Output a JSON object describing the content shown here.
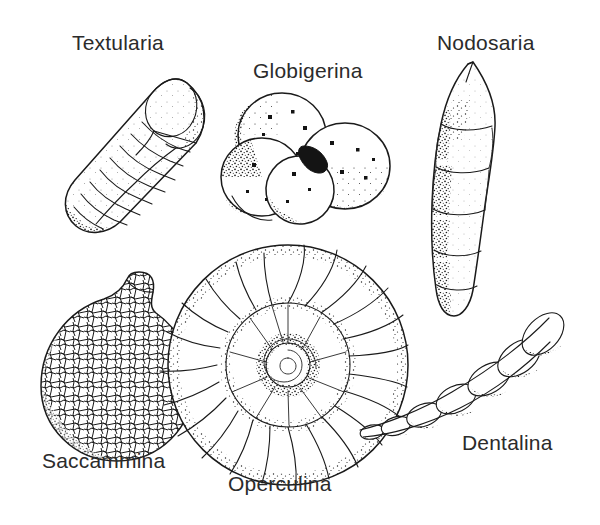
{
  "plate": {
    "title": "Foraminifera genera illustration plate",
    "background_color": "#ffffff",
    "ink_color": "#1a1a1a",
    "label_color": "#2b2b2b",
    "style": "black and white stippled line drawing"
  },
  "specimens": [
    {
      "id": "textularia",
      "label": "Textularia",
      "label_x": 72,
      "label_y": 50,
      "description": "elongate biserial test with two alternating rows of chevron chambers tapering to lower left",
      "chamber_count": 14
    },
    {
      "id": "globigerina",
      "label": "Globigerina",
      "label_x": 253,
      "label_y": 78,
      "description": "cluster of five inflated globular chambers with pores and dark central aperture",
      "chamber_count": 5
    },
    {
      "id": "nodosaria",
      "label": "Nodosaria",
      "label_x": 437,
      "label_y": 50,
      "description": "uniserial straight stack of rounded chambers with pointed apical spine",
      "chamber_count": 6
    },
    {
      "id": "saccammina",
      "label": "Saccammina",
      "label_x": 42,
      "label_y": 468,
      "description": "single spherical agglutinated test with short neck and mosaic of sand grains",
      "chamber_count": 1
    },
    {
      "id": "operculina",
      "label": "Operculina",
      "label_x": 228,
      "label_y": 491,
      "description": "planispiral involute coil with numerous radial septa and inner whorl",
      "chamber_count": 22
    },
    {
      "id": "dentalina",
      "label": "Dentalina",
      "label_x": 462,
      "label_y": 450,
      "description": "arcuate uniserial chain of chambers increasing in size toward the aperture",
      "chamber_count": 7
    }
  ]
}
